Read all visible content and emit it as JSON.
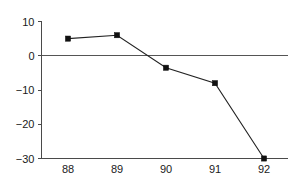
{
  "chart_data": {
    "type": "line",
    "title": "",
    "subtitle": "",
    "xlabel": "",
    "ylabel": "",
    "categories": [
      "88",
      "89",
      "90",
      "91",
      "92"
    ],
    "x": [
      88,
      89,
      90,
      91,
      92
    ],
    "values": [
      5,
      6,
      -3.5,
      -8,
      -30
    ],
    "series": [
      {
        "name": "series-1",
        "values": [
          5,
          6,
          -3.5,
          -8,
          -30
        ],
        "marker": "square",
        "marker_color": "#111111",
        "line_color": "#222222"
      }
    ],
    "xlim": [
      87.6,
      92.4
    ],
    "ylim": [
      -30,
      10
    ],
    "y_ticks": [
      10,
      0,
      -10,
      -20,
      -30
    ],
    "y_tick_labels": [
      "10",
      "0",
      "−10",
      "−20",
      "−30"
    ],
    "x_ticks": [
      88,
      89,
      90,
      91,
      92
    ],
    "x_tick_labels": [
      "88",
      "89",
      "90",
      "91",
      "92"
    ],
    "grid": false,
    "legend": null,
    "legend_position": "none",
    "annotations": [],
    "zero_line": true,
    "axis_color": "#4a4a4a",
    "background_color": "#ffffff"
  }
}
